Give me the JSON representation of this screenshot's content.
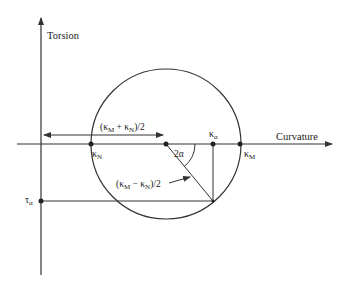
{
  "diagram": {
    "axes": {
      "vertical_label": "Torsion",
      "horizontal_label": "Curvature"
    },
    "points": {
      "kappa_N": {
        "main": "κ",
        "sub": "N"
      },
      "kappa_M": {
        "main": "κ",
        "sub": "M"
      },
      "kappa_alpha": {
        "main": "κ",
        "sub": "α"
      },
      "tau_alpha": {
        "main": "τ",
        "sub": "α"
      }
    },
    "annotations": {
      "center_offset": {
        "open": "(κ",
        "sub1": "M",
        "mid": " + κ",
        "sub2": "N",
        "close": ")/2"
      },
      "radius": {
        "open": "(κ",
        "sub1": "M",
        "mid": " − κ",
        "sub2": "N",
        "close": ")/2"
      },
      "angle": "2α"
    },
    "colors": {
      "line": "#333333",
      "background": "#ffffff"
    }
  }
}
